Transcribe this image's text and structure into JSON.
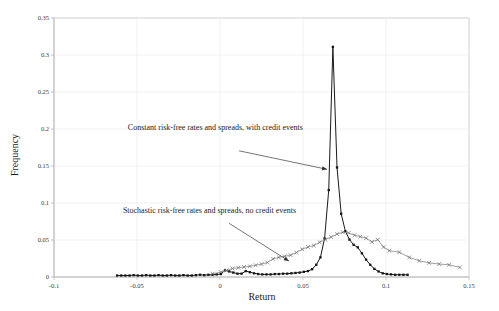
{
  "chart_data": {
    "type": "line",
    "title": "",
    "xlabel": "Return",
    "ylabel": "Frequency",
    "xlim": [
      -0.1,
      0.15
    ],
    "ylim": [
      0,
      0.35
    ],
    "grid": false,
    "legend_position": "none",
    "xticks": [
      "-0.1",
      "-0.05",
      "0",
      "0.05",
      "0.1",
      "0.15"
    ],
    "xtick_values": [
      -0.1,
      -0.05,
      0,
      0.05,
      0.1,
      0.15
    ],
    "yticks": [
      "0",
      "0.05",
      "0.1",
      "0.15",
      "0.2",
      "0.25",
      "0.3",
      "0.35"
    ],
    "ytick_values": [
      0,
      0.05,
      0.1,
      0.15,
      0.2,
      0.25,
      0.3,
      0.35
    ],
    "annotations": [
      {
        "name": "annotation-constant",
        "text": "Constant risk-free rates and spreads, with credit events",
        "text_x": -0.0555,
        "text_y": 0.1985,
        "arrow_from_x": 0.0115,
        "arrow_from_y": 0.1705,
        "arrow_to_x": 0.0645,
        "arrow_to_y": 0.1455
      },
      {
        "name": "annotation-stochastic",
        "text": "Stochastic risk-free rates and spreads, no credit events",
        "text_x": -0.0585,
        "text_y": 0.0865,
        "arrow_from_x": 0.0055,
        "arrow_from_y": 0.0725,
        "arrow_to_x": 0.0415,
        "arrow_to_y": 0.0215
      }
    ],
    "series": [
      {
        "name": "Constant risk-free rates and spreads, with credit events",
        "color": "#1a1a1a",
        "marker": "square",
        "x": [
          -0.062,
          -0.0595,
          -0.057,
          -0.0545,
          -0.052,
          -0.0495,
          -0.047,
          -0.0445,
          -0.042,
          -0.0395,
          -0.037,
          -0.0345,
          -0.032,
          -0.0295,
          -0.027,
          -0.0245,
          -0.022,
          -0.0195,
          -0.017,
          -0.0145,
          -0.012,
          -0.0095,
          -0.007,
          -0.0045,
          -0.002,
          0.0005,
          0.003,
          0.0055,
          0.008,
          0.0105,
          0.013,
          0.0155,
          0.018,
          0.0205,
          0.023,
          0.0255,
          0.028,
          0.0305,
          0.033,
          0.0355,
          0.038,
          0.0405,
          0.043,
          0.0455,
          0.048,
          0.0505,
          0.053,
          0.0555,
          0.058,
          0.0605,
          0.063,
          0.0655,
          0.068,
          0.0705,
          0.073,
          0.0755,
          0.078,
          0.0805,
          0.083,
          0.0855,
          0.088,
          0.0905,
          0.093,
          0.0955,
          0.098,
          0.1005,
          0.103,
          0.1055,
          0.108,
          0.1105,
          0.113
        ],
        "y": [
          0.002,
          0.002,
          0.002,
          0.002,
          0.0025,
          0.002,
          0.002,
          0.0025,
          0.002,
          0.002,
          0.0025,
          0.002,
          0.002,
          0.0025,
          0.002,
          0.002,
          0.0025,
          0.002,
          0.002,
          0.0025,
          0.003,
          0.0025,
          0.003,
          0.003,
          0.0035,
          0.004,
          0.009,
          0.0075,
          0.006,
          0.0045,
          0.0045,
          0.008,
          0.0065,
          0.005,
          0.004,
          0.0035,
          0.0035,
          0.0035,
          0.004,
          0.004,
          0.0045,
          0.0045,
          0.005,
          0.0055,
          0.006,
          0.007,
          0.008,
          0.0105,
          0.0165,
          0.0265,
          0.052,
          0.1175,
          0.311,
          0.148,
          0.0855,
          0.062,
          0.0505,
          0.0435,
          0.04,
          0.032,
          0.0235,
          0.0165,
          0.011,
          0.0075,
          0.005,
          0.004,
          0.0035,
          0.003,
          0.003,
          0.003,
          0.003
        ]
      },
      {
        "name": "Stochastic risk-free rates and spreads, no credit events",
        "color": "#8a8a8a",
        "marker": "x",
        "x": [
          -0.0045,
          0.0005,
          0.004,
          0.0075,
          0.011,
          0.0145,
          0.018,
          0.0215,
          0.025,
          0.0285,
          0.032,
          0.0355,
          0.039,
          0.0425,
          0.046,
          0.0495,
          0.053,
          0.0565,
          0.06,
          0.0635,
          0.067,
          0.0705,
          0.074,
          0.0775,
          0.081,
          0.0845,
          0.088,
          0.0915,
          0.095,
          0.0985,
          0.102,
          0.108,
          0.114,
          0.12,
          0.126,
          0.132,
          0.138,
          0.1445
        ],
        "y": [
          0.0045,
          0.0065,
          0.009,
          0.0115,
          0.0125,
          0.0135,
          0.0145,
          0.016,
          0.0175,
          0.0195,
          0.0245,
          0.0265,
          0.028,
          0.0295,
          0.033,
          0.0375,
          0.0405,
          0.0425,
          0.047,
          0.0505,
          0.054,
          0.058,
          0.0605,
          0.0595,
          0.0565,
          0.0545,
          0.0525,
          0.0475,
          0.0505,
          0.0405,
          0.0355,
          0.0335,
          0.0265,
          0.022,
          0.019,
          0.0175,
          0.0165,
          0.013
        ]
      }
    ]
  },
  "axes": {
    "x_title": "Return",
    "y_title": "Frequency"
  }
}
